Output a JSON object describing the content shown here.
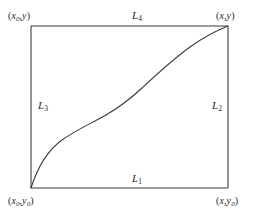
{
  "figure": {
    "background_color": "#ffffff",
    "stroke_color": "#3a3a3a",
    "text_color": "#262626",
    "rectangle": {
      "left": 31,
      "top": 26,
      "right": 228,
      "bottom": 188
    },
    "corners": [
      {
        "name": "top-left",
        "open_paren": "(",
        "x_symbol": "x",
        "x_subscript": "0",
        "comma": ",",
        "y_symbol": "y",
        "y_subscript": "",
        "close_paren": ")",
        "full_text": "(x0,y)"
      },
      {
        "name": "top-right",
        "open_paren": "(",
        "x_symbol": "x",
        "x_subscript": "",
        "comma": ",",
        "y_symbol": "y",
        "y_subscript": "",
        "close_paren": ")",
        "full_text": "(x,y)"
      },
      {
        "name": "bottom-left",
        "open_paren": "(",
        "x_symbol": "x",
        "x_subscript": "0",
        "comma": ",",
        "y_symbol": "y",
        "y_subscript": "0",
        "close_paren": ")",
        "full_text": "(x0,y0)"
      },
      {
        "name": "bottom-right",
        "open_paren": "(",
        "x_symbol": "x",
        "x_subscript": "",
        "comma": ",",
        "y_symbol": "y",
        "y_subscript": "0",
        "close_paren": ")",
        "full_text": "(x,y0)"
      }
    ],
    "edges": [
      {
        "name": "bottom",
        "symbol": "L",
        "subscript": "1",
        "full_text": "L1"
      },
      {
        "name": "right",
        "symbol": "L",
        "subscript": "2",
        "full_text": "L2"
      },
      {
        "name": "left",
        "symbol": "L",
        "subscript": "3",
        "full_text": "L3"
      },
      {
        "name": "top",
        "symbol": "L",
        "subscript": "4",
        "full_text": "L4"
      }
    ],
    "curve": {
      "type": "sigmoid-path",
      "description": "S-shaped monotone curve from bottom-left corner to top-right corner",
      "start": [
        31,
        188
      ],
      "end": [
        228,
        26
      ],
      "path": "M 31 188 C 38 166, 48 150, 62 140 C 76 130, 92 123, 106 115 C 120 107, 130 99, 142 88 C 156 75, 172 60, 190 47 C 204 37, 218 30, 228 26"
    }
  }
}
